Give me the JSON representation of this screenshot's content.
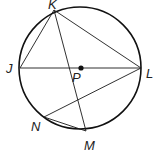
{
  "diagram": {
    "type": "circle-geometry",
    "colors": {
      "stroke": "#1a1a1a",
      "circle_stroke": "#111111",
      "label": "#222222",
      "background": "#ffffff"
    },
    "circle": {
      "center_label": "P",
      "cx": 80,
      "cy": 68,
      "r": 61
    },
    "points": [
      {
        "name": "K",
        "x": 54,
        "y": 10,
        "label_x": 48,
        "label_y": 10
      },
      {
        "name": "J",
        "x": 20,
        "y": 68,
        "label_x": 6,
        "label_y": 73
      },
      {
        "name": "L",
        "x": 141,
        "y": 68,
        "label_x": 146,
        "label_y": 78
      },
      {
        "name": "P",
        "x": 81,
        "y": 68,
        "label_x": 72,
        "label_y": 82
      },
      {
        "name": "N",
        "x": 44,
        "y": 117,
        "label_x": 31,
        "label_y": 131
      },
      {
        "name": "M",
        "x": 86,
        "y": 131,
        "label_x": 84,
        "label_y": 150
      }
    ],
    "segments": [
      {
        "from": "J",
        "to": "L"
      },
      {
        "from": "K",
        "to": "J"
      },
      {
        "from": "K",
        "to": "L"
      },
      {
        "from": "K",
        "to": "M"
      },
      {
        "from": "L",
        "to": "N"
      },
      {
        "from": "N",
        "to": "M"
      }
    ],
    "labels": {
      "K": "K",
      "J": "J",
      "L": "L",
      "P": "P",
      "N": "N",
      "M": "M"
    }
  }
}
